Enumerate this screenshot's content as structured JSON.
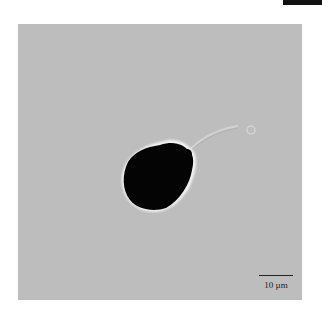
{
  "figure": {
    "top_bar_color": "#111111",
    "panel_background": "#bdbdbd",
    "cell": {
      "description": "dark cell body with faint curved flagellum-like tail ending in small ring"
    },
    "scale_bar": {
      "label": "10 µm"
    }
  }
}
